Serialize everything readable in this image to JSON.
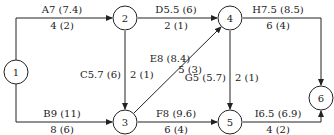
{
  "diagram": {
    "type": "activity-on-arrow network",
    "nodes": [
      {
        "id": "1",
        "label": "1"
      },
      {
        "id": "2",
        "label": "2"
      },
      {
        "id": "3",
        "label": "3"
      },
      {
        "id": "4",
        "label": "4"
      },
      {
        "id": "5",
        "label": "5"
      },
      {
        "id": "6",
        "label": "6"
      }
    ],
    "edges": [
      {
        "from": "1",
        "to": "2",
        "top": "A7 (7.4)",
        "bottom": "4 (2)"
      },
      {
        "from": "1",
        "to": "3",
        "top": "B9 (11)",
        "bottom": "8 (6)"
      },
      {
        "from": "2",
        "to": "3",
        "left": "C5.7 (6)",
        "right": "2 (1)"
      },
      {
        "from": "2",
        "to": "4",
        "top": "D5.5 (6)",
        "bottom": "2 (1)"
      },
      {
        "from": "3",
        "to": "4",
        "top": "E8 (8.4)",
        "bottom": "5 (3)"
      },
      {
        "from": "3",
        "to": "5",
        "top": "F8 (9.6)",
        "bottom": "6 (4)"
      },
      {
        "from": "4",
        "to": "5",
        "left": "G5 (5.7)",
        "right": "2 (1)"
      },
      {
        "from": "4",
        "to": "6",
        "top": "H7.5 (8.5)",
        "bottom": "6 (4)"
      },
      {
        "from": "5",
        "to": "6",
        "top": "I6.5 (6.9)",
        "bottom": "4 (2)"
      }
    ]
  }
}
